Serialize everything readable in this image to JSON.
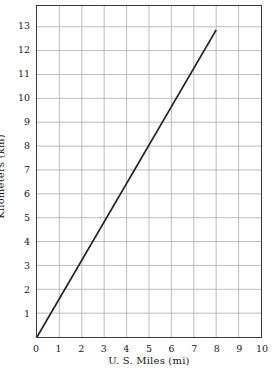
{
  "chart_data": {
    "type": "line",
    "title": "",
    "subtitle": "",
    "xlabel": "U. S. Miles (mi)",
    "ylabel": "Kilometers (km)",
    "xlim": [
      0,
      10
    ],
    "ylim": [
      0,
      13.87
    ],
    "xticks": [
      0,
      1,
      2,
      3,
      4,
      5,
      6,
      7,
      8,
      9,
      10
    ],
    "xtick_labels": [
      "0",
      "1",
      "2",
      "3",
      "4",
      "5",
      "6",
      "7",
      "8",
      "9",
      "10"
    ],
    "yticks": [
      1,
      2,
      3,
      4,
      5,
      6,
      7,
      8,
      9,
      10,
      11,
      12,
      13
    ],
    "ytick_labels": [
      "1",
      "2",
      "3",
      "4",
      "5",
      "6",
      "7",
      "8",
      "9",
      "10",
      "11",
      "12",
      "13"
    ],
    "grid": true,
    "grid_color": "#b5b5b5",
    "axis_color": "#3a3a3a",
    "legend": null,
    "legend_position": "none",
    "annotations": [],
    "series": [
      {
        "name": "miles-to-kilometers",
        "color": "#222222",
        "line_width": 1.7,
        "x": [
          0,
          8
        ],
        "y": [
          0,
          12.87
        ],
        "points": [
          {
            "x": 0,
            "y": 0
          },
          {
            "x": 1,
            "y": 1.61
          },
          {
            "x": 2,
            "y": 3.22
          },
          {
            "x": 3,
            "y": 4.83
          },
          {
            "x": 4,
            "y": 6.44
          },
          {
            "x": 5,
            "y": 8.05
          },
          {
            "x": 6,
            "y": 9.66
          },
          {
            "x": 7,
            "y": 11.27
          },
          {
            "x": 8,
            "y": 12.87
          }
        ],
        "slope": 1.609
      }
    ]
  }
}
